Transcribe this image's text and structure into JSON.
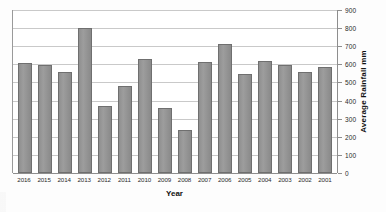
{
  "chart_data": {
    "type": "bar",
    "title": "",
    "xlabel": "Year",
    "ylabel": "Average Rainfall mm",
    "categories": [
      "2016",
      "2015",
      "2014",
      "2013",
      "2012",
      "2011",
      "2010",
      "2009",
      "2008",
      "2007",
      "2006",
      "2005",
      "2004",
      "2003",
      "2002",
      "2001"
    ],
    "values": [
      605,
      595,
      560,
      800,
      370,
      480,
      630,
      360,
      235,
      615,
      715,
      545,
      620,
      595,
      560,
      585
    ],
    "series": [
      {
        "name": "Average Rainfall mm",
        "values": [
          605,
          595,
          560,
          800,
          370,
          480,
          630,
          360,
          235,
          615,
          715,
          545,
          620,
          595,
          560,
          585
        ]
      }
    ],
    "ylim": [
      0,
      900
    ],
    "ytick_step": 100,
    "yticks": [
      0,
      100,
      200,
      300,
      400,
      500,
      600,
      700,
      800,
      900
    ],
    "ytick_labels": [
      "0",
      "100",
      "200",
      "300",
      "400",
      "500",
      "600",
      "700",
      "800",
      "900"
    ],
    "y_axis_position": "right",
    "grid": "horizontal",
    "legend": "none",
    "bar_color": "#949494",
    "bar_border_color": "#6f6f6f",
    "grid_color": "#c9c9c9",
    "axis_color": "#8e8e8e",
    "background": "#ffffff"
  }
}
